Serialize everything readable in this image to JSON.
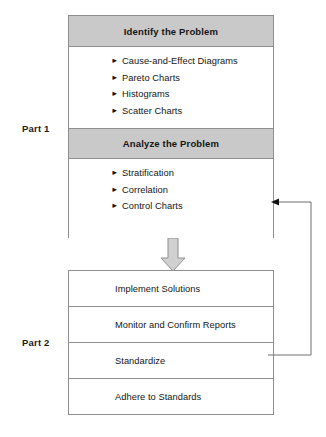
{
  "diagram": {
    "part1": {
      "label": "Part 1",
      "sections": [
        {
          "header": "Identify the Problem",
          "bullet_glyph": "►",
          "items": [
            "Cause-and-Effect Diagrams",
            "Pareto Charts",
            "Histograms",
            "Scatter Charts"
          ]
        },
        {
          "header": "Analyze the Problem",
          "bullet_glyph": "►",
          "items": [
            "Stratification",
            "Correlation",
            "Control Charts"
          ]
        }
      ]
    },
    "part2": {
      "label": "Part 2",
      "steps": [
        "Implement Solutions",
        "Monitor and Confirm Reports",
        "Standardize",
        "Adhere to Standards"
      ]
    },
    "connectors": {
      "flow_arrow": "down-arrow",
      "feedback_arrow": "feedback-loop-arrow"
    },
    "colors": {
      "header_band": "#c9c9c9",
      "border": "#8f8f8f",
      "text": "#141414",
      "background": "#ffffff",
      "arrow_fill": "#d0d0d0"
    }
  }
}
